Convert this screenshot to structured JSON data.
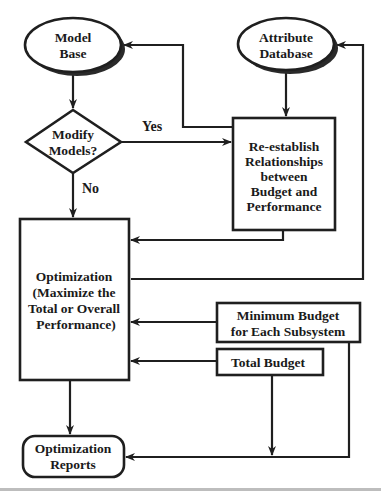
{
  "diagram": {
    "type": "flowchart",
    "nodes": {
      "model_base": {
        "shape": "ellipse",
        "lines": [
          "Model",
          "Base"
        ]
      },
      "attribute_database": {
        "shape": "ellipse",
        "lines": [
          "Attribute",
          "Database"
        ]
      },
      "modify_models": {
        "shape": "diamond",
        "lines": [
          "Modify",
          "Models?"
        ]
      },
      "reestablish": {
        "shape": "rectangle",
        "lines": [
          "Re-establish",
          "Relationships",
          "between",
          "Budget and",
          "Performance"
        ]
      },
      "optimization": {
        "shape": "rectangle",
        "lines": [
          "Optimization",
          "(Maximize the",
          "Total or Overall",
          "Performance)"
        ]
      },
      "minimum_budget": {
        "shape": "rectangle",
        "lines": [
          "Minimum Budget",
          "for Each Subsystem"
        ]
      },
      "total_budget": {
        "shape": "rectangle",
        "lines": [
          "Total Budget"
        ]
      },
      "optimization_reports": {
        "shape": "rounded-rectangle",
        "lines": [
          "Optimization",
          "Reports"
        ]
      }
    },
    "edge_labels": {
      "yes": "Yes",
      "no": "No"
    },
    "edges": [
      {
        "from": "model_base",
        "to": "modify_models"
      },
      {
        "from": "modify_models",
        "to": "reestablish",
        "label": "Yes"
      },
      {
        "from": "modify_models",
        "to": "optimization",
        "label": "No"
      },
      {
        "from": "reestablish",
        "to": "model_base"
      },
      {
        "from": "attribute_database",
        "to": "reestablish"
      },
      {
        "from": "reestablish",
        "to": "optimization"
      },
      {
        "from": "optimization",
        "to": "attribute_database"
      },
      {
        "from": "minimum_budget",
        "to": "optimization"
      },
      {
        "from": "total_budget",
        "to": "optimization"
      },
      {
        "from": "optimization",
        "to": "optimization_reports"
      },
      {
        "from": "total_budget",
        "to": "optimization_reports"
      },
      {
        "from": "minimum_budget",
        "to": "optimization_reports"
      }
    ],
    "colors": {
      "stroke": "#1f1f1f",
      "shadow": "#2a2a2a",
      "background": "#ffffff"
    }
  }
}
